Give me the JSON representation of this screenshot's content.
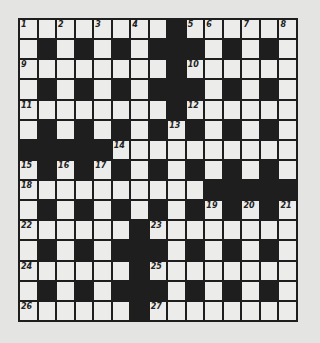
{
  "puzzle": {
    "size": {
      "rows": 15,
      "cols": 15
    },
    "colors": {
      "block": "#1e1e1e",
      "cell": "#ececea",
      "background": "#e4e4e2"
    },
    "grid": [
      "........#......",
      ".#.#.#.###.#.#.",
      "........#......",
      ".#.#.#.###.#.#.",
      "........#......",
      ".#.#.#.#.#.#.#.",
      "#####..........",
      ".#.#.#.#.#.#.#.",
      "..........#####",
      ".#.#.#.#.#.#.#.",
      "......#........",
      ".#.#.###.#.#.#.",
      "......#........",
      ".#.#.###.#.#.#.",
      "......#........"
    ],
    "numbers": [
      {
        "row": 0,
        "col": 0,
        "n": "1"
      },
      {
        "row": 0,
        "col": 2,
        "n": "2"
      },
      {
        "row": 0,
        "col": 4,
        "n": "3"
      },
      {
        "row": 0,
        "col": 6,
        "n": "4"
      },
      {
        "row": 0,
        "col": 9,
        "n": "5"
      },
      {
        "row": 0,
        "col": 10,
        "n": "6"
      },
      {
        "row": 0,
        "col": 12,
        "n": "7"
      },
      {
        "row": 0,
        "col": 14,
        "n": "8"
      },
      {
        "row": 2,
        "col": 0,
        "n": "9"
      },
      {
        "row": 2,
        "col": 9,
        "n": "10"
      },
      {
        "row": 4,
        "col": 0,
        "n": "11"
      },
      {
        "row": 4,
        "col": 9,
        "n": "12"
      },
      {
        "row": 5,
        "col": 8,
        "n": "13"
      },
      {
        "row": 6,
        "col": 5,
        "n": "14"
      },
      {
        "row": 7,
        "col": 0,
        "n": "15"
      },
      {
        "row": 7,
        "col": 2,
        "n": "16"
      },
      {
        "row": 7,
        "col": 4,
        "n": "17"
      },
      {
        "row": 8,
        "col": 0,
        "n": "18"
      },
      {
        "row": 9,
        "col": 10,
        "n": "19"
      },
      {
        "row": 9,
        "col": 12,
        "n": "20"
      },
      {
        "row": 9,
        "col": 14,
        "n": "21"
      },
      {
        "row": 10,
        "col": 0,
        "n": "22"
      },
      {
        "row": 10,
        "col": 7,
        "n": "23"
      },
      {
        "row": 12,
        "col": 0,
        "n": "24"
      },
      {
        "row": 12,
        "col": 7,
        "n": "25"
      },
      {
        "row": 14,
        "col": 0,
        "n": "26"
      },
      {
        "row": 14,
        "col": 7,
        "n": "27"
      }
    ]
  }
}
